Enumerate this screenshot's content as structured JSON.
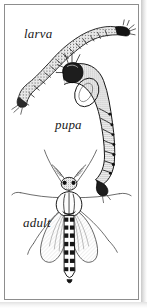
{
  "plate": {
    "kind": "scientific-illustration-plate",
    "subject": "midge life stages",
    "background_color": "#ffffff",
    "frame_color": "#8d8d8d",
    "ink_color": "#1a1a1a",
    "width": 147,
    "height": 308
  },
  "labels": {
    "larva": "larva",
    "pupa": "pupa",
    "adult": "adult"
  },
  "figures": [
    {
      "name": "larva",
      "label": "larva",
      "description": "elongate curved segmented worm-like larva, head at upper right, body sweeping down to lower left",
      "stage_order": 1
    },
    {
      "name": "pupa",
      "label": "pupa",
      "description": "comma-shaped pupa with swollen cephalothorax at upper left and tapering segmented abdomen curving down to lower right",
      "stage_order": 2
    },
    {
      "name": "adult",
      "label": "adult",
      "description": "dorsal view of adult midge with plumose antennae, two spread wings and six long slender legs, banded segmented abdomen",
      "stage_order": 3
    }
  ]
}
